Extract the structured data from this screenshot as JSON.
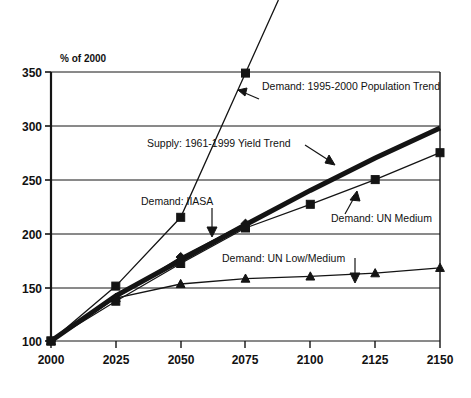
{
  "chart_data": {
    "type": "line",
    "title": "",
    "xlabel": "",
    "ylabel": "% of 2000",
    "xlim": [
      2000,
      2150
    ],
    "ylim": [
      100,
      350
    ],
    "xticks": [
      "2000",
      "2025",
      "2050",
      "2075",
      "2100",
      "2125",
      "2150"
    ],
    "yticks": [
      "100",
      "150",
      "200",
      "250",
      "300",
      "350"
    ],
    "grid": true,
    "legend": "in-plot annotations",
    "x": [
      2000,
      2025,
      2050,
      2075,
      2100,
      2125,
      2150
    ],
    "series": [
      {
        "name": "Supply: 1961-1999 Yield Trend",
        "marker": "none",
        "style": "thick-line",
        "values": [
          100,
          142,
          175,
          208,
          240,
          270,
          298
        ]
      },
      {
        "name": "Demand: 1995-2000 Population Trend",
        "marker": "square",
        "style": "thin-line",
        "values": [
          100,
          151,
          215,
          349,
          null,
          null,
          null
        ]
      },
      {
        "name": "Demand: IIASA",
        "marker": "diamond",
        "style": "thin-line",
        "values": [
          100,
          140,
          178,
          209,
          null,
          null,
          null
        ]
      },
      {
        "name": "Demand: UN Medium",
        "marker": "square",
        "style": "thin-line",
        "values": [
          100,
          137,
          172,
          205,
          227,
          250,
          275
        ]
      },
      {
        "name": "Demand: UN Low/Medium",
        "marker": "triangle",
        "style": "thin-line",
        "values": [
          100,
          140,
          153,
          158,
          160,
          163,
          168
        ]
      }
    ],
    "annotations": [
      {
        "id": "pop-trend",
        "text": "Demand: 1995-2000 Population Trend"
      },
      {
        "id": "supply",
        "text": "Supply: 1961-1999 Yield Trend"
      },
      {
        "id": "iiasa",
        "text": "Demand: IIASA"
      },
      {
        "id": "un-medium",
        "text": "Demand: UN Medium"
      },
      {
        "id": "un-low-med",
        "text": "Demand: UN Low/Medium"
      }
    ],
    "colors": {
      "ink": "#141414",
      "grid": "#141414",
      "background": "#ffffff"
    }
  }
}
